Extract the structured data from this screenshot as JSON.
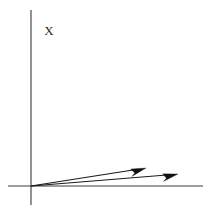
{
  "figure": {
    "background_color": "#ffffff",
    "width": 210,
    "height": 213
  },
  "labels": {
    "vertical_axis_label": "X"
  },
  "chart_data": {
    "type": "scatter",
    "title": "",
    "xlabel": "",
    "ylabel": "X",
    "grid": false,
    "legend": null,
    "axes": {
      "origin": {
        "x": 31,
        "y": 186
      },
      "vertical_axis": {
        "x": 31,
        "y_top": 10,
        "y_bottom": 205
      },
      "horizontal_axis": {
        "y": 186,
        "x_left": 8,
        "x_right": 203
      }
    },
    "annotations": [
      {
        "name": "axis-label-x",
        "text": "X",
        "x": 49,
        "y": 35
      }
    ],
    "series": [
      {
        "name": "vector-1",
        "type": "arrow",
        "start": {
          "x": 31,
          "y": 186
        },
        "end": {
          "x": 146,
          "y": 168
        },
        "color": "#1a1a1a"
      },
      {
        "name": "vector-2",
        "type": "arrow",
        "start": {
          "x": 31,
          "y": 186
        },
        "end": {
          "x": 178,
          "y": 174
        },
        "color": "#1a1a1a"
      }
    ]
  }
}
